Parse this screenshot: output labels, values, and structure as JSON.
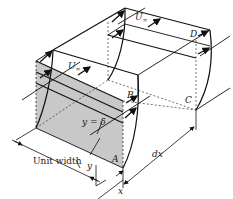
{
  "figure": {
    "colors": {
      "line": "#111111",
      "shade": "#c8c8c8",
      "background": "#ffffff"
    },
    "labels": {
      "u_inf_top": "U",
      "u_inf_top_sub": "∞",
      "u_inf_front": "U",
      "u_inf_front_sub": "∞",
      "point_a": "A",
      "point_b": "B",
      "point_c": "C",
      "point_d": "D",
      "delta_eq": "y = δ",
      "unit_width": "Unit width",
      "dx": "dx",
      "y_axis": "y",
      "x_axis": "x"
    }
  }
}
